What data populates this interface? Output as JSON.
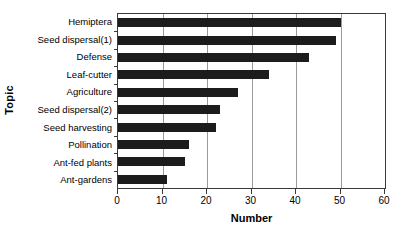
{
  "chart_data": {
    "type": "bar",
    "orientation": "horizontal",
    "title": "",
    "xlabel": "Number",
    "ylabel": "Topic",
    "xlim": [
      0,
      60
    ],
    "xticks": [
      0,
      10,
      20,
      30,
      40,
      50,
      60
    ],
    "grid": true,
    "grid_axis": "x",
    "legend": false,
    "bar_color": "#1c1c1c",
    "categories": [
      "Hemiptera",
      "Seed dispersal(1)",
      "Defense",
      "Leaf-cutter",
      "Agriculture",
      "Seed dispersal(2)",
      "Seed harvesting",
      "Pollination",
      "Ant-fed plants",
      "Ant-gardens"
    ],
    "values": [
      50,
      49,
      43,
      34,
      27,
      23,
      22,
      16,
      15,
      11
    ]
  }
}
